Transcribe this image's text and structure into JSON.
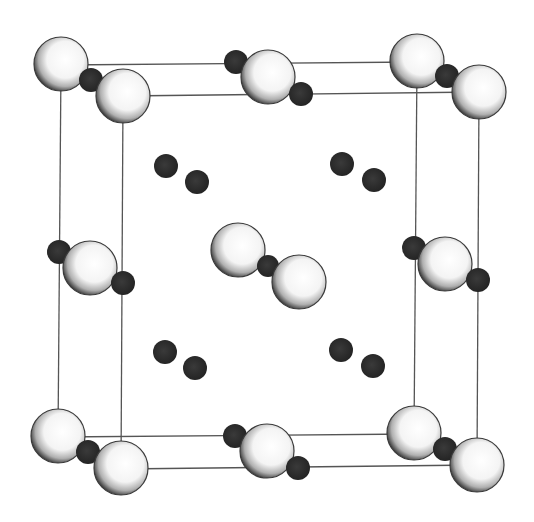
{
  "figure": {
    "title": "Crystal structure unit cell"
  },
  "colors": {
    "background": "#ffffff",
    "cell_edge": "#555555",
    "large_atom_fill": "#ffffff",
    "large_atom_shade": "#3a3a3a",
    "small_atom_fill": "#2e2e2e"
  },
  "cell": {
    "back": [
      [
        61,
        65
      ],
      [
        417,
        62
      ],
      [
        414,
        434
      ],
      [
        58,
        437
      ]
    ],
    "front": [
      [
        123,
        96
      ],
      [
        479,
        92
      ],
      [
        477,
        465
      ],
      [
        121,
        469
      ]
    ]
  },
  "large_atoms": [
    {
      "x": 61,
      "y": 64,
      "r": 27
    },
    {
      "x": 123,
      "y": 96,
      "r": 27
    },
    {
      "x": 417,
      "y": 61,
      "r": 27
    },
    {
      "x": 479,
      "y": 92,
      "r": 27
    },
    {
      "x": 58,
      "y": 436,
      "r": 27
    },
    {
      "x": 121,
      "y": 468,
      "r": 27
    },
    {
      "x": 414,
      "y": 433,
      "r": 27
    },
    {
      "x": 477,
      "y": 465,
      "r": 27
    },
    {
      "x": 268,
      "y": 77,
      "r": 27
    },
    {
      "x": 267,
      "y": 451,
      "r": 27
    },
    {
      "x": 90,
      "y": 268,
      "r": 27
    },
    {
      "x": 445,
      "y": 264,
      "r": 27
    },
    {
      "x": 238,
      "y": 250,
      "r": 27
    },
    {
      "x": 299,
      "y": 282,
      "r": 27
    }
  ],
  "small_atoms": [
    {
      "x": 91,
      "y": 80,
      "r": 12
    },
    {
      "x": 447,
      "y": 76,
      "r": 12
    },
    {
      "x": 88,
      "y": 452,
      "r": 12
    },
    {
      "x": 445,
      "y": 449,
      "r": 12
    },
    {
      "x": 236,
      "y": 62,
      "r": 12
    },
    {
      "x": 301,
      "y": 94,
      "r": 12
    },
    {
      "x": 235,
      "y": 436,
      "r": 12
    },
    {
      "x": 298,
      "y": 468,
      "r": 12
    },
    {
      "x": 59,
      "y": 252,
      "r": 12
    },
    {
      "x": 123,
      "y": 283,
      "r": 12
    },
    {
      "x": 414,
      "y": 248,
      "r": 12
    },
    {
      "x": 478,
      "y": 280,
      "r": 12
    },
    {
      "x": 268,
      "y": 266,
      "r": 11
    },
    {
      "x": 166,
      "y": 166,
      "r": 12
    },
    {
      "x": 197,
      "y": 182,
      "r": 12
    },
    {
      "x": 342,
      "y": 164,
      "r": 12
    },
    {
      "x": 374,
      "y": 180,
      "r": 12
    },
    {
      "x": 165,
      "y": 352,
      "r": 12
    },
    {
      "x": 195,
      "y": 368,
      "r": 12
    },
    {
      "x": 341,
      "y": 350,
      "r": 12
    },
    {
      "x": 373,
      "y": 366,
      "r": 12
    }
  ]
}
